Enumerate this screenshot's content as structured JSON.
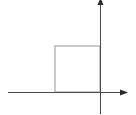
{
  "diagram": {
    "colors": {
      "background": "#ffffff",
      "axis": "#4a4a4a",
      "square": "#a8a8a8"
    },
    "x_axis": {
      "x1": 8,
      "y": 92,
      "x2": 128,
      "arrow": "right"
    },
    "y_axis": {
      "x": 100,
      "y1": 114,
      "y2": 0,
      "arrow": "up"
    },
    "square": {
      "x": 55,
      "y": 46,
      "width": 45,
      "height": 46
    }
  }
}
